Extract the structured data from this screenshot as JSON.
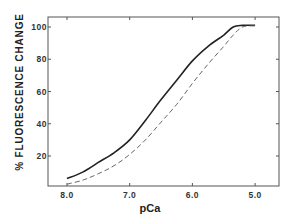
{
  "chart_data": {
    "type": "line",
    "title": "",
    "xlabel": "pCa",
    "ylabel": "% FLUORESCENCE CHANGE",
    "xlim": [
      8.2,
      4.6
    ],
    "ylim": [
      0,
      110
    ],
    "x_reversed": true,
    "grid": false,
    "legend": null,
    "x_ticks": [
      "8.0",
      "7.0",
      "6.0",
      "5.0"
    ],
    "y_ticks": [
      "20",
      "40",
      "60",
      "80",
      "100"
    ],
    "x": [
      8.0,
      7.75,
      7.5,
      7.25,
      7.0,
      6.75,
      6.5,
      6.25,
      6.0,
      5.75,
      5.5,
      5.35,
      5.2,
      5.0
    ],
    "series": [
      {
        "name": "solid",
        "style": "solid",
        "values": [
          6,
          10,
          16,
          22,
          30,
          42,
          55,
          67,
          79,
          88,
          95,
          100,
          101,
          101
        ]
      },
      {
        "name": "dashed",
        "style": "dashed",
        "values": [
          2.5,
          5,
          9,
          14,
          21,
          30,
          41,
          52,
          65,
          77,
          88,
          95,
          100,
          101
        ]
      }
    ]
  },
  "axes": {
    "x_title": "pCa",
    "y_title": "% FLUORESCENCE CHANGE",
    "x_tick_labels": [
      "8.0",
      "7.0",
      "6.0",
      "5.0"
    ],
    "y_tick_labels": [
      "20",
      "40",
      "60",
      "80",
      "100"
    ]
  }
}
